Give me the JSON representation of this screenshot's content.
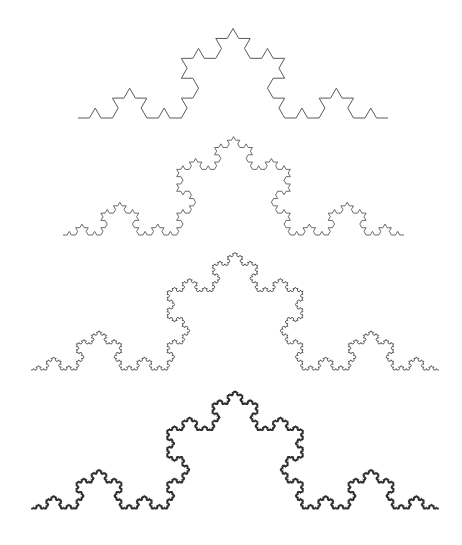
{
  "figure": {
    "background": "#ffffff",
    "curves": [
      {
        "name": "koch-iteration-3",
        "iteration": 3,
        "x0": 78,
        "x1": 388,
        "baseline_y": 118,
        "stroke": "#5a5a5a",
        "stroke_width": 1.0
      },
      {
        "name": "koch-iteration-4",
        "iteration": 4,
        "x0": 63,
        "x1": 404,
        "baseline_y": 235,
        "stroke": "#5a5a5a",
        "stroke_width": 0.9
      },
      {
        "name": "koch-iteration-5",
        "iteration": 5,
        "x0": 31,
        "x1": 439,
        "baseline_y": 370,
        "stroke": "#4a4a4a",
        "stroke_width": 0.9
      },
      {
        "name": "koch-iteration-6",
        "iteration": 6,
        "x0": 31,
        "x1": 439,
        "baseline_y": 509,
        "stroke": "#2e2e2e",
        "stroke_width": 1.2
      }
    ]
  }
}
